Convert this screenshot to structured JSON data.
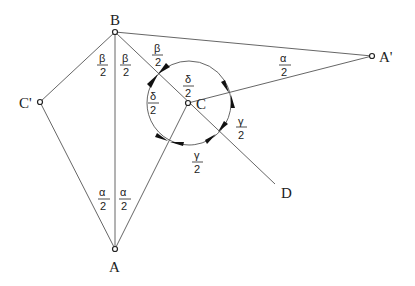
{
  "diagram": {
    "points": {
      "B": {
        "label": "B",
        "x": 115,
        "y": 32
      },
      "C": {
        "label": "C",
        "x": 188,
        "y": 103
      },
      "C_prime": {
        "label": "C'",
        "x": 40,
        "y": 102
      },
      "A": {
        "label": "A",
        "x": 115,
        "y": 249
      },
      "A_prime": {
        "label": "A'",
        "x": 372,
        "y": 56
      },
      "D": {
        "label": "D",
        "x": 275,
        "y": 184
      }
    },
    "angle_labels": {
      "beta_1": {
        "num": "β",
        "den": "2"
      },
      "beta_2": {
        "num": "β",
        "den": "2"
      },
      "beta_3": {
        "num": "β",
        "den": "2"
      },
      "delta_1": {
        "num": "δ",
        "den": "2"
      },
      "delta_2": {
        "num": "δ",
        "den": "2"
      },
      "gamma_1": {
        "num": "γ",
        "den": "2"
      },
      "gamma_2": {
        "num": "γ",
        "den": "2"
      },
      "alpha_1": {
        "num": "α",
        "den": "2"
      },
      "alpha_2": {
        "num": "α",
        "den": "2"
      },
      "alpha_3": {
        "num": "α",
        "den": "2"
      }
    },
    "circle": {
      "center": "C",
      "radius": 42
    }
  }
}
